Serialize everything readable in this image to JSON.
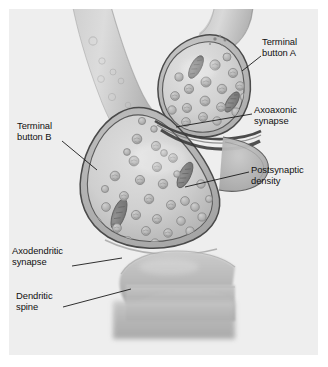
{
  "figure": {
    "panel_background": "#eeeeee",
    "page_background": "#ffffff",
    "width": 328,
    "height": 367
  },
  "palette": {
    "panel_bg": "#eeeeee",
    "membrane_outline": "#4a4a4a",
    "cytoplasm_light": "#d8d8d8",
    "cytoplasm_mid": "#c4c4c4",
    "cytoplasm_dark": "#a9a9a9",
    "vesicle_fill": "#b6b6b6",
    "vesicle_outline": "#8d8d8d",
    "mitochondria": "#7c7c7c",
    "dendrite_fill": "#b9b9b9",
    "label_text": "#111111",
    "leader_line": "#1a1a1a"
  },
  "labels": [
    {
      "id": "terminal-button-a",
      "lines": [
        "Terminal",
        "button A"
      ],
      "text": "Terminal button A",
      "x": 262,
      "y": 42,
      "align": "left"
    },
    {
      "id": "axoaxonic-synapse",
      "lines": [
        "Axoaxonic",
        "synapse"
      ],
      "text": "Axoaxonic synapse",
      "x": 254,
      "y": 108,
      "align": "left"
    },
    {
      "id": "postsynaptic-density",
      "lines": [
        "Postsynaptic",
        "density"
      ],
      "text": "Postsynaptic density",
      "x": 251,
      "y": 168,
      "align": "left"
    },
    {
      "id": "terminal-button-b",
      "lines": [
        "Terminal",
        "button B"
      ],
      "text": "Terminal button B",
      "x": 17,
      "y": 124,
      "align": "left"
    },
    {
      "id": "axodendritic-synapse",
      "lines": [
        "Axodendritic",
        "synapse"
      ],
      "text": "Axodendritic synapse",
      "x": 12,
      "y": 249,
      "align": "left"
    },
    {
      "id": "dendritic-spine",
      "lines": [
        "Dendritic",
        "spine"
      ],
      "text": "Dendritic spine",
      "x": 16,
      "y": 294,
      "align": "left"
    }
  ],
  "leader_lines": [
    {
      "id": "leader-terminal-button-a",
      "x1": 242,
      "y1": 71,
      "x2": 261,
      "y2": 56
    },
    {
      "id": "leader-axoaxonic-synapse",
      "x1": 176,
      "y1": 127,
      "x2": 252,
      "y2": 114
    },
    {
      "id": "leader-postsynaptic-density",
      "x1": 185,
      "y1": 187,
      "x2": 249,
      "y2": 172
    },
    {
      "id": "leader-terminal-button-b",
      "x1": 62,
      "y1": 141,
      "x2": 97,
      "y2": 170
    },
    {
      "id": "leader-axodendritic-synapse",
      "x1": 72,
      "y1": 266,
      "x2": 122,
      "y2": 258
    },
    {
      "id": "leader-dendritic-spine",
      "x1": 63,
      "y1": 307,
      "x2": 131,
      "y2": 289
    }
  ],
  "structures": [
    {
      "id": "axon-b",
      "name": "Axon of terminal button B",
      "description": "Tapering axon descending from the top-left of the panel"
    },
    {
      "id": "axon-a",
      "name": "Axon of terminal button A",
      "description": "Axon descending from the top-right into terminal button A"
    },
    {
      "id": "terminal-button-a",
      "name": "Terminal button A",
      "description": "Pear-shaped presynaptic bouton, upper right",
      "vesicle_count": 18,
      "mitochondria_count": 2
    },
    {
      "id": "terminal-button-b",
      "name": "Terminal button B",
      "description": "Large rounded-triangular presynaptic bouton, center",
      "vesicle_count": 34,
      "mitochondria_count": 2
    },
    {
      "id": "axoaxonic-synapse",
      "name": "Axoaxonic synapse",
      "description": "Contact zone where terminal button A synapses onto terminal button B"
    },
    {
      "id": "postsynaptic-density",
      "name": "Postsynaptic density",
      "description": "Thickened dark membrane region on the postsynaptic side"
    },
    {
      "id": "axodendritic-synapse",
      "name": "Axodendritic synapse",
      "description": "Contact zone between terminal button B and the dendritic spine"
    },
    {
      "id": "dendritic-spine",
      "name": "Dendritic spine",
      "description": "Mushroom-shaped spine projecting from the dendrite shaft at lower center"
    },
    {
      "id": "dendrite-shaft",
      "name": "Dendrite shaft",
      "description": "Horizontal band at the bottom of the panel"
    }
  ]
}
